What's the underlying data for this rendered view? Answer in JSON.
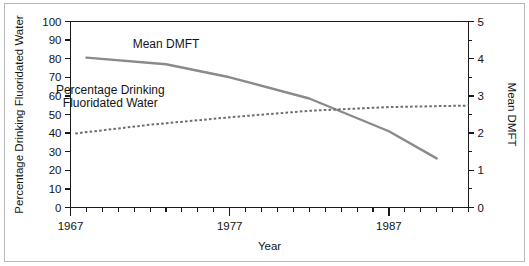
{
  "chart_data": {
    "type": "line",
    "title": "",
    "xlabel": "Year",
    "ylabel_left": "Percentage Drinking Fluoridated Water",
    "ylabel_right": "Mean DMFT",
    "xlim": [
      1967,
      1992
    ],
    "ylim_left": [
      0,
      100
    ],
    "ylim_right": [
      0,
      5
    ],
    "grid": false,
    "legend": "inline-annotations",
    "x_major_ticks": [
      1967,
      1977,
      1987
    ],
    "x_major_tick_labels": [
      "1967",
      "1977",
      "1987"
    ],
    "x_minor_tick_step": 1,
    "y_left_ticks": [
      0,
      10,
      20,
      30,
      40,
      50,
      60,
      70,
      80,
      90,
      100
    ],
    "y_left_tick_labels": [
      "0",
      "10",
      "20",
      "30",
      "40",
      "50",
      "60",
      "70",
      "80",
      "90",
      "100"
    ],
    "y_right_ticks": [
      0,
      1,
      2,
      3,
      4,
      5
    ],
    "y_right_tick_labels": [
      "0",
      "1",
      "2",
      "3",
      "4",
      "5"
    ],
    "y_right_minor_tick_step": 0.5,
    "series": [
      {
        "name": "Mean DMFT",
        "axis": "right",
        "style": "solid",
        "color": "#8a8a8a",
        "x": [
          1968.0,
          1973.0,
          1977.0,
          1982.0,
          1987.0,
          1990.0
        ],
        "values": [
          4.03,
          3.85,
          3.5,
          2.93,
          2.05,
          1.32
        ]
      },
      {
        "name": "Percentage Drinking Fluoridated Water",
        "axis": "left",
        "style": "dotted",
        "color": "#6e6e6e",
        "x": [
          1967.3,
          1972.0,
          1977.0,
          1982.0,
          1987.0,
          1992.0
        ],
        "values": [
          39.8,
          44.5,
          48.5,
          52.0,
          54.0,
          54.8
        ]
      }
    ],
    "annotations": [
      {
        "text": "Mean DMFT",
        "x": 1973.0,
        "y_left": 86
      },
      {
        "text": "Percentage Drinking",
        "x": 1969.5,
        "y_left": 61
      },
      {
        "text": "Fluoridated Water",
        "x": 1969.5,
        "y_left": 54
      }
    ]
  },
  "axes": {
    "x_title": "Year",
    "y_left_title": "Percentage Drinking Fluoridated Water",
    "y_right_title": "Mean DMFT"
  },
  "annotations": {
    "mean_dmft": "Mean DMFT",
    "percentage_line1": "Percentage Drinking",
    "percentage_line2": "Fluoridated Water"
  }
}
